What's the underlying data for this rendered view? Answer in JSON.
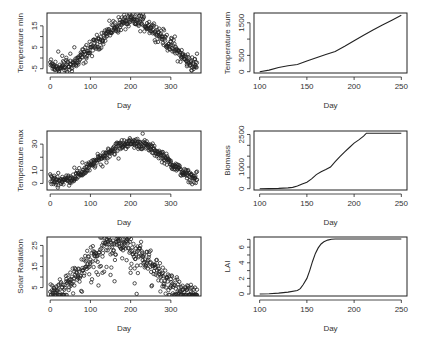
{
  "chart_data": [
    {
      "id": "tmin",
      "type": "scatter",
      "xlabel": "Day",
      "ylabel": "Temperature min",
      "xlim": [
        -8,
        375
      ],
      "ylim": [
        -7,
        21
      ],
      "xticks": [
        0,
        100,
        200,
        300
      ],
      "xtick_labels": [
        "0",
        "100",
        "200",
        "300"
      ],
      "yticks": [
        -5,
        0,
        5,
        10,
        15
      ],
      "ytick_labels": [
        "-5",
        "",
        "5",
        "",
        "15"
      ],
      "seasonal": {
        "mean": 6.5,
        "amp": 11,
        "peak_day": 205,
        "noise": 3.2
      },
      "x": [
        0,
        10,
        20,
        30,
        40,
        50,
        60,
        70,
        80,
        90,
        100,
        110,
        120,
        130,
        140,
        150,
        160,
        170,
        180,
        190,
        200,
        210,
        220,
        230,
        240,
        250,
        260,
        270,
        280,
        290,
        300,
        310,
        320,
        330,
        340,
        350,
        360,
        365
      ],
      "y": [
        -2,
        -5,
        3,
        1,
        -1,
        2,
        5,
        -3,
        4,
        6,
        5,
        7,
        9,
        8,
        10,
        12,
        14,
        13,
        16,
        17,
        17,
        16,
        15,
        18,
        14,
        14,
        12,
        12,
        10,
        5,
        6,
        10,
        3,
        2,
        -3,
        -2,
        -4,
        2
      ]
    },
    {
      "id": "tsum",
      "type": "line",
      "xlabel": "Day",
      "ylabel": "Temperature sum",
      "xlim": [
        94,
        256
      ],
      "ylim": [
        -40,
        1800
      ],
      "xticks": [
        100,
        150,
        200,
        250
      ],
      "xtick_labels": [
        "100",
        "150",
        "200",
        "250"
      ],
      "yticks": [
        0,
        500,
        1000,
        1500
      ],
      "ytick_labels": [
        "0",
        "500",
        "",
        "1500"
      ],
      "x": [
        100,
        110,
        120,
        130,
        140,
        150,
        160,
        170,
        180,
        190,
        200,
        210,
        220,
        230,
        240,
        250
      ],
      "y": [
        0,
        50,
        130,
        180,
        220,
        330,
        430,
        530,
        620,
        780,
        950,
        1120,
        1280,
        1430,
        1580,
        1730
      ]
    },
    {
      "id": "tmax",
      "type": "scatter",
      "xlabel": "Day",
      "ylabel": "Temperature max",
      "xlim": [
        -8,
        375
      ],
      "ylim": [
        -5,
        40
      ],
      "xticks": [
        0,
        100,
        200,
        300
      ],
      "xtick_labels": [
        "0",
        "100",
        "200",
        "300"
      ],
      "yticks": [
        0,
        10,
        20,
        30
      ],
      "ytick_labels": [
        "0",
        "10",
        "",
        "30"
      ],
      "seasonal": {
        "mean": 16.5,
        "amp": 14.5,
        "peak_day": 205,
        "noise": 3.5
      },
      "x": [
        0,
        10,
        20,
        30,
        40,
        50,
        60,
        70,
        80,
        90,
        100,
        110,
        120,
        130,
        140,
        150,
        160,
        170,
        180,
        190,
        200,
        210,
        220,
        230,
        240,
        250,
        260,
        270,
        280,
        290,
        300,
        310,
        320,
        330,
        340,
        350,
        360,
        365
      ],
      "y": [
        7,
        1,
        8,
        5,
        6,
        4,
        12,
        5,
        16,
        15,
        14,
        18,
        20,
        13,
        16,
        24,
        22,
        19,
        28,
        32,
        30,
        29,
        28,
        38,
        30,
        26,
        25,
        22,
        24,
        18,
        16,
        14,
        12,
        8,
        4,
        7,
        4,
        9
      ]
    },
    {
      "id": "biomass",
      "type": "line",
      "xlabel": "Day",
      "ylabel": "Biomass",
      "xlim": [
        94,
        256
      ],
      "ylim": [
        -60,
        2660
      ],
      "xticks": [
        100,
        150,
        200,
        250
      ],
      "xtick_labels": [
        "100",
        "150",
        "200",
        "250"
      ],
      "yticks": [
        0,
        500,
        1000,
        1500,
        2000,
        2500
      ],
      "ytick_labels": [
        "0",
        "",
        "1000",
        "",
        "",
        "2500"
      ],
      "x": [
        100,
        110,
        120,
        130,
        135,
        140,
        145,
        150,
        155,
        160,
        165,
        170,
        175,
        180,
        185,
        190,
        195,
        200,
        205,
        210,
        213,
        220,
        230,
        240,
        250
      ],
      "y": [
        0,
        5,
        15,
        35,
        60,
        120,
        220,
        300,
        450,
        650,
        780,
        880,
        1000,
        1250,
        1480,
        1700,
        1900,
        2100,
        2250,
        2420,
        2560,
        2560,
        2560,
        2560,
        2560
      ]
    },
    {
      "id": "radiation",
      "type": "scatter",
      "xlabel": "Day",
      "ylabel": "Solar Radiation",
      "xlim": [
        -8,
        375
      ],
      "ylim": [
        1,
        29
      ],
      "xticks": [
        0,
        100,
        200,
        300
      ],
      "xtick_labels": [
        "0",
        "100",
        "200",
        "300"
      ],
      "yticks": [
        5,
        10,
        15,
        20,
        25
      ],
      "ytick_labels": [
        "5",
        "",
        "15",
        "",
        "25"
      ],
      "seasonal": {
        "mean": 14.5,
        "amp": 12.5,
        "peak_day": 172,
        "noise": 4.5
      },
      "x": [
        0,
        10,
        20,
        30,
        40,
        50,
        60,
        70,
        80,
        90,
        100,
        110,
        120,
        130,
        140,
        150,
        160,
        170,
        180,
        190,
        200,
        210,
        215,
        220,
        230,
        240,
        250,
        260,
        270,
        280,
        290,
        300,
        310,
        320,
        330,
        340,
        350,
        360,
        365
      ],
      "y": [
        3,
        4,
        6,
        5,
        8,
        9,
        6,
        14,
        13,
        15,
        17,
        20,
        6,
        12,
        28,
        11,
        8,
        27,
        24,
        18,
        12,
        7,
        2,
        20,
        18,
        22,
        17,
        16,
        14,
        12,
        10,
        9,
        6,
        5,
        4,
        4,
        3,
        5,
        4
      ]
    },
    {
      "id": "lai",
      "type": "line",
      "xlabel": "Day",
      "ylabel": "LAI",
      "xlim": [
        94,
        256
      ],
      "ylim": [
        -0.25,
        7.3
      ],
      "xticks": [
        100,
        150,
        200,
        250
      ],
      "xtick_labels": [
        "100",
        "150",
        "200",
        "250"
      ],
      "yticks": [
        0,
        1,
        2,
        3,
        4,
        5,
        6,
        7
      ],
      "ytick_labels": [
        "0",
        "",
        "2",
        "",
        "4",
        "",
        "6",
        ""
      ],
      "x": [
        100,
        110,
        120,
        130,
        140,
        143,
        146,
        150,
        153,
        156,
        159,
        162,
        165,
        168,
        172,
        176,
        180,
        190,
        200,
        210,
        220,
        230,
        240,
        250
      ],
      "y": [
        0,
        0.05,
        0.12,
        0.25,
        0.45,
        0.7,
        1.2,
        2.0,
        3.0,
        4.2,
        5.2,
        5.9,
        6.4,
        6.7,
        6.9,
        7.0,
        7.05,
        7.05,
        7.05,
        7.05,
        7.05,
        7.05,
        7.05,
        7.05
      ]
    }
  ],
  "layout": {
    "panels": [
      {
        "id": "tmin",
        "frame": [
          47,
          13,
          201,
          73
        ]
      },
      {
        "id": "tsum",
        "frame": [
          254,
          13,
          407,
          73
        ]
      },
      {
        "id": "tmax",
        "frame": [
          47,
          131,
          201,
          190
        ]
      },
      {
        "id": "biomass",
        "frame": [
          254,
          131,
          407,
          190
        ]
      },
      {
        "id": "radiation",
        "frame": [
          47,
          237,
          201,
          296
        ]
      },
      {
        "id": "lai",
        "frame": [
          254,
          237,
          407,
          296
        ]
      }
    ],
    "colors": {
      "ink": "#222222",
      "text": "#333333",
      "background": "#ffffff"
    }
  }
}
